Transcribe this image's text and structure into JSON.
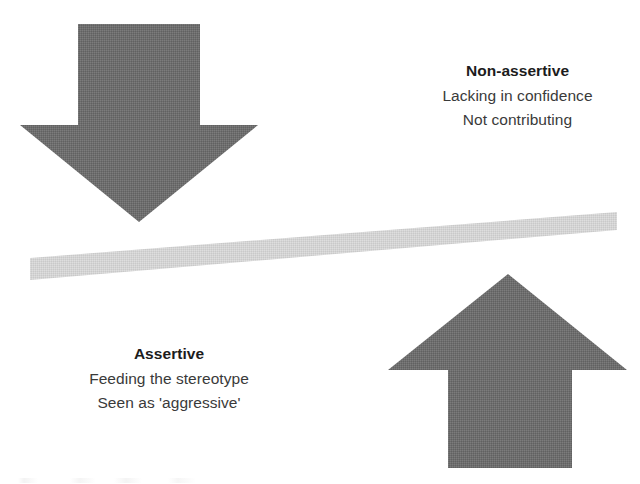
{
  "diagram": {
    "type": "balance-seesaw",
    "colors": {
      "arrow_fill": "#6e6e6e",
      "beam_fill": "#d2d2d2",
      "background": "#ffffff",
      "title_text": "#1c1c1c",
      "body_text": "#3a3a3a"
    },
    "beam": {
      "name": "seesaw-beam",
      "left_end": {
        "x": 30,
        "y": 269
      },
      "right_end": {
        "x": 617,
        "y": 221
      },
      "thickness": 17
    },
    "arrows": [
      {
        "name": "down-arrow",
        "direction": "down",
        "tip": {
          "x": 139,
          "y": 222
        },
        "shaft_top": {
          "y": 24
        },
        "head_width": 238,
        "shaft_width": 122
      },
      {
        "name": "up-arrow",
        "direction": "up",
        "tip": {
          "x": 508,
          "y": 274
        },
        "shaft_bottom": {
          "y": 468
        },
        "head_width": 239,
        "shaft_width": 124
      }
    ]
  },
  "labels": {
    "nonassertive": {
      "title": "Non-assertive",
      "lines": [
        "Lacking in confidence",
        "Not contributing"
      ]
    },
    "assertive": {
      "title": "Assertive",
      "lines": [
        "Feeding the stereotype",
        "Seen as 'aggressive'"
      ]
    }
  }
}
